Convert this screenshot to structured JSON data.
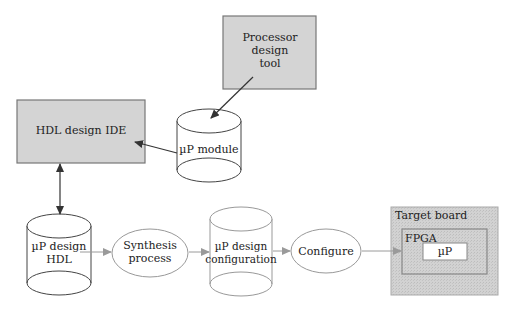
{
  "diagram": {
    "colors": {
      "box_fill": "#d4d4d4",
      "box_stroke": "#777777",
      "line": "#444444",
      "light_arrow": "#9a9a9a",
      "board_fill": "#cfcfcf",
      "fpga_stroke": "#888888"
    },
    "nodes": {
      "processor_tool": {
        "lines": [
          "Processor",
          "design",
          "tool"
        ],
        "shape": "rectangle"
      },
      "hdl_ide": {
        "label": "HDL design IDE",
        "shape": "rectangle"
      },
      "up_module": {
        "label": "µP module",
        "shape": "cylinder"
      },
      "up_design_hdl": {
        "lines": [
          "µP design",
          "HDL"
        ],
        "shape": "cylinder"
      },
      "synthesis": {
        "lines": [
          "Synthesis",
          "process"
        ],
        "shape": "ellipse"
      },
      "up_design_config": {
        "lines": [
          "µP design",
          "configuration"
        ],
        "shape": "cylinder"
      },
      "configure": {
        "label": "Configure",
        "shape": "ellipse"
      },
      "target_board": {
        "label": "Target board",
        "shape": "rectangle"
      },
      "fpga": {
        "label": "FPGA",
        "shape": "rectangle"
      },
      "up": {
        "label": "µP",
        "shape": "rectangle"
      }
    },
    "edges": [
      {
        "from": "processor_tool",
        "to": "up_module"
      },
      {
        "from": "up_module",
        "to": "hdl_ide"
      },
      {
        "from": "hdl_ide",
        "to": "up_design_hdl",
        "bidirectional": true
      },
      {
        "from": "up_design_hdl",
        "to": "synthesis"
      },
      {
        "from": "synthesis",
        "to": "up_design_config"
      },
      {
        "from": "up_design_config",
        "to": "configure"
      },
      {
        "from": "configure",
        "to": "fpga"
      }
    ]
  }
}
